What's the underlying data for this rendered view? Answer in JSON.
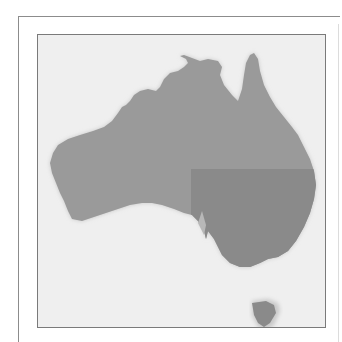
{
  "map": {
    "title": "Map of Australia",
    "subject": "Australia",
    "highlighted_region": "South-eastern Australia",
    "colors": {
      "page_background": "#ffffff",
      "map_background": "#efefef",
      "land": "#9a9a9a",
      "highlighted_region": "#8a8a8a",
      "frame_border": "#7a7a7a",
      "coast_shadow": "#c8c8c8"
    },
    "features": [
      {
        "name": "mainland",
        "highlighted": false
      },
      {
        "name": "south-east-region",
        "highlighted": true
      },
      {
        "name": "tasmania",
        "highlighted": true
      }
    ]
  }
}
